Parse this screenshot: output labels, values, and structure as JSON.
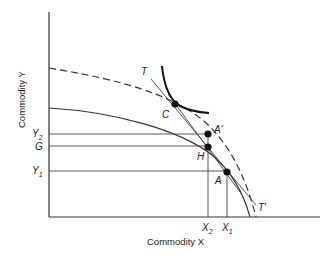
{
  "axes": {
    "y_label": "Commodity Y",
    "x_label": "Commodity X"
  },
  "y_ticks": [
    {
      "label": "Y",
      "sub": "2"
    },
    {
      "label": "G",
      "sub": ""
    },
    {
      "label": "Y",
      "sub": "1"
    }
  ],
  "x_ticks": [
    {
      "label": "X",
      "sub": "2"
    },
    {
      "label": "X",
      "sub": "1"
    }
  ],
  "points": {
    "C": "C",
    "A_prime": "A'",
    "H": "H",
    "A": "A"
  },
  "lines": {
    "T": "T",
    "T_prime": "T'"
  },
  "colors": {
    "ink": "#222222",
    "background": "#ffffff"
  }
}
